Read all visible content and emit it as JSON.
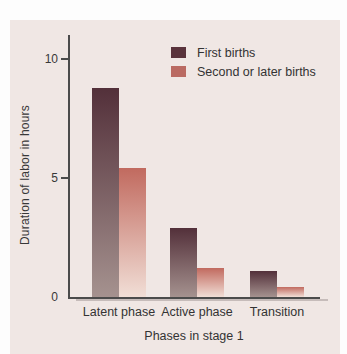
{
  "figure": {
    "page_background": "#fdfdfd",
    "panel_background": "#f0e7e4",
    "axis_color": "#4b4b4b",
    "text_color": "#333333"
  },
  "chart_data": {
    "type": "bar",
    "title": "",
    "categories": [
      "Latent phase",
      "Active phase",
      "Transition"
    ],
    "series": [
      {
        "name": "First births",
        "values": [
          8.8,
          2.9,
          1.1
        ],
        "color_top": "#53303a",
        "color_bottom": "#a5928f",
        "legend_color": "#5a333c"
      },
      {
        "name": "Second or later births",
        "values": [
          5.4,
          1.2,
          0.4
        ],
        "color_top": "#c16a5f",
        "color_bottom": "#f1ded6",
        "legend_color": "#ba6a62"
      }
    ],
    "xlabel": "Phases in stage 1",
    "ylabel": "Duration of labor in hours",
    "ylim": [
      0,
      11
    ],
    "yticks": [
      0,
      5,
      10
    ],
    "legend_position": "top-right",
    "grid": false
  }
}
